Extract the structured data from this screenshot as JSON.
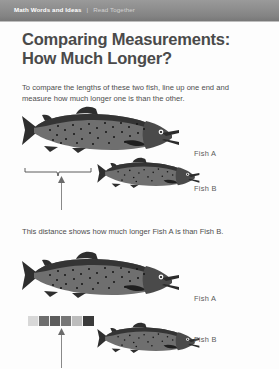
{
  "header": {
    "breadcrumb_primary": "Math Words and Ideas",
    "breadcrumb_separator": "|",
    "breadcrumb_secondary": "Read Together",
    "bar_color": "#8d8d8d"
  },
  "page": {
    "title_line1": "Comparing Measurements:",
    "title_line2": "How Much Longer?",
    "title_color": "#4a4a4a",
    "intro_paragraph": "To compare the lengths of these two fish, line up one end and measure how much longer one is than the other.",
    "middle_paragraph": "This distance shows how much longer Fish A is than Fish B.",
    "body_color": "#4d4d4d",
    "background": "#ffffff"
  },
  "figures": {
    "top": {
      "fish_a_label": "Fish A",
      "fish_b_label": "Fish B",
      "brace_caption_target": "This distance shows how much longer Fish A is than Fish B.",
      "indicator": "up-arrow"
    },
    "bottom": {
      "fish_a_label": "Fish A",
      "fish_b_label": "Fish B",
      "indicator": "up-arrow",
      "cube_count": 6,
      "cube_colors": [
        "#d8d8d8",
        "#6e6e6e",
        "#5c5c5c",
        "#767676",
        "#bdbdbd",
        "#3a3a3a"
      ]
    }
  },
  "fish_art": {
    "body_color": "#3d3d3d",
    "belly_color": "#6f6f6f",
    "spot_color": "#1a1a1a",
    "outline_color": "#1c1c1c"
  }
}
